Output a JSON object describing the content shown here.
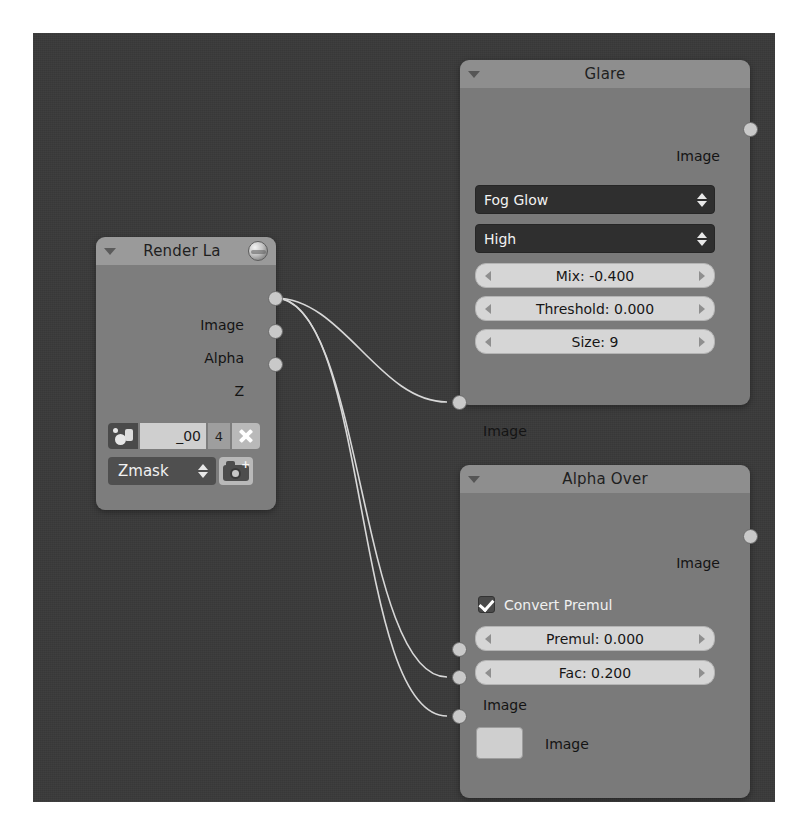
{
  "app": {
    "editor": "blender-compositor-node-editor",
    "canvas_background": "#3a3a3a",
    "page_background": "#ffffff"
  },
  "nodes": [
    {
      "id": "render-layers",
      "title": "Render La",
      "header_icon": "sphere-icon",
      "collapse_icon": "triangle-down-icon",
      "header_color": "#9a9a9a",
      "body_color": "#7d7d7d",
      "outputs": [
        {
          "label": "Image"
        },
        {
          "label": "Alpha"
        },
        {
          "label": "Z"
        }
      ],
      "datablock": {
        "icon": "scene-icon",
        "name": "_00",
        "users": "4",
        "unlink_icon": "x-icon"
      },
      "layer_enum": {
        "value": "Zmask",
        "arrows_icon": "up-down-arrows-icon",
        "render_icon": "camera-add-icon"
      }
    },
    {
      "id": "glare",
      "title": "Glare",
      "collapse_icon": "triangle-down-icon",
      "header_color": "#8e8e8e",
      "body_color": "#7a7a7a",
      "outputs": [
        {
          "label": "Image"
        }
      ],
      "inputs": [
        {
          "label": "Image"
        }
      ],
      "enums": [
        {
          "name": "glare-type",
          "value": "Fog Glow"
        },
        {
          "name": "quality",
          "value": "High"
        }
      ],
      "sliders": [
        {
          "name": "mix",
          "value": "Mix: -0.400"
        },
        {
          "name": "threshold",
          "value": "Threshold: 0.000"
        },
        {
          "name": "size",
          "value": "Size: 9"
        }
      ]
    },
    {
      "id": "alpha-over",
      "title": "Alpha Over",
      "collapse_icon": "triangle-down-icon",
      "header_color": "#8e8e8e",
      "body_color": "#7a7a7a",
      "outputs": [
        {
          "label": "Image"
        }
      ],
      "checkbox": {
        "label": "Convert Premul",
        "checked": true
      },
      "sliders": [
        {
          "name": "premul",
          "value": "Premul: 0.000"
        },
        {
          "name": "fac",
          "value": "Fac: 0.200"
        }
      ],
      "inputs": [
        {
          "label": "Image"
        },
        {
          "label": "Image",
          "swatch": "#cfcfcf"
        }
      ]
    }
  ],
  "links": [
    {
      "from": "render-layers.Image",
      "to": "glare.Image"
    },
    {
      "from": "render-layers.Image",
      "to": "alpha-over.Image-1"
    },
    {
      "from": "render-layers.Image",
      "to": "alpha-over.Image-2"
    }
  ]
}
